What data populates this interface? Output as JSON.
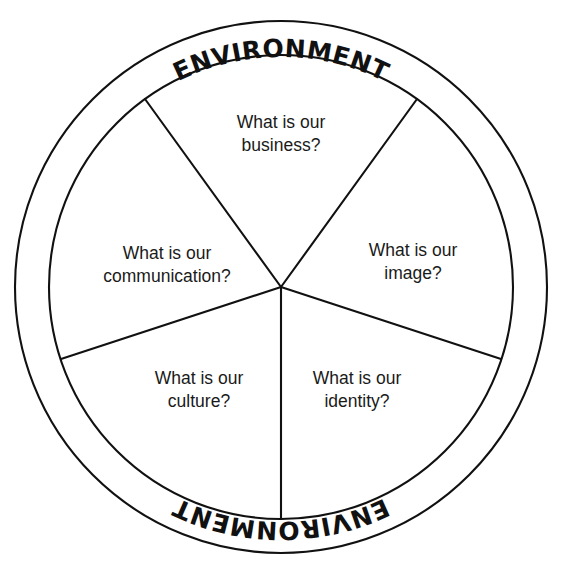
{
  "diagram": {
    "type": "segmented-wheel",
    "ring": {
      "label_top": "ENVIRONMENT",
      "label_bottom": "ENVIRONMENT"
    },
    "colors": {
      "stroke": "#111111",
      "background": "#ffffff",
      "label_text": "#1a1a1a"
    },
    "geometry": {
      "center_x": 281,
      "center_y": 287,
      "outer_radius": 266,
      "ring_inner_radius": 232,
      "segment_count": 5,
      "start_angle_deg": 90
    },
    "segments": [
      {
        "id": "business",
        "line1": "What is our",
        "line2": "business?",
        "label_x": 281,
        "label_y": 134
      },
      {
        "id": "image",
        "line1": "What is our",
        "line2": "image?",
        "label_x": 413,
        "label_y": 262
      },
      {
        "id": "identity",
        "line1": "What is our",
        "line2": "identity?",
        "label_x": 357,
        "label_y": 390
      },
      {
        "id": "culture",
        "line1": "What is our",
        "line2": "culture?",
        "label_x": 199,
        "label_y": 390
      },
      {
        "id": "communication",
        "line1": "What is our",
        "line2": "communication?",
        "label_x": 167,
        "label_y": 265
      }
    ]
  },
  "chart_data": {
    "type": "pie",
    "categories": [
      "What is our business?",
      "What is our image?",
      "What is our identity?",
      "What is our culture?",
      "What is our communication?"
    ],
    "values": [
      20,
      20,
      20,
      20,
      20
    ],
    "annotations": [
      "ENVIRONMENT",
      "ENVIRONMENT"
    ],
    "legend": "none",
    "grid": false
  }
}
